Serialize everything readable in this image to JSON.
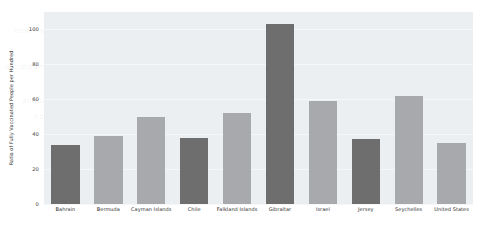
{
  "chart_data": {
    "type": "bar",
    "title": "",
    "xlabel": "",
    "ylabel": "Ratio of Fully Vaccinated People per Hundred",
    "ylim": [
      0,
      110
    ],
    "yticks": [
      0,
      20,
      40,
      60,
      80,
      100
    ],
    "grid": true,
    "legend": "none",
    "categories": [
      "Bahrain",
      "Bermuda",
      "Cayman Islands",
      "Chile",
      "Falkland Islands",
      "Gibraltar",
      "Israel",
      "Jersey",
      "Seychelles",
      "United States"
    ],
    "values": [
      34,
      39,
      50,
      38,
      52,
      103,
      59,
      37,
      62,
      35
    ],
    "bar_colors": [
      "#6e6e6e",
      "#a7a9ac",
      "#a7a9ac",
      "#6e6e6e",
      "#a7a9ac",
      "#6e6e6e",
      "#a7a9ac",
      "#6e6e6e",
      "#a7a9ac",
      "#a7a9ac"
    ]
  },
  "axes": {
    "y_tick_labels": [
      "100",
      "80",
      "60",
      "40",
      "20",
      "0"
    ],
    "y_axis_title": "Ratio of Fully Vaccinated People per Hundred"
  },
  "colors": {
    "plot_background": "#eceff1",
    "page_background": "#ffffff",
    "bar_light": "#a7a9ac",
    "bar_dark": "#6e6e6e",
    "gridline": "#f6f7f8",
    "tick_text": "#2e2e2e"
  },
  "watermark": {
    "lines": [
      "lorem ipsum dolor sit amet consectetur",
      "adipiscing elit sed do eiusmod tempor",
      "incididunt ut labore et dolore magna",
      "aliqua ut enim ad minim veniam quis",
      "nostrud exercitation ullamco laboris"
    ]
  }
}
